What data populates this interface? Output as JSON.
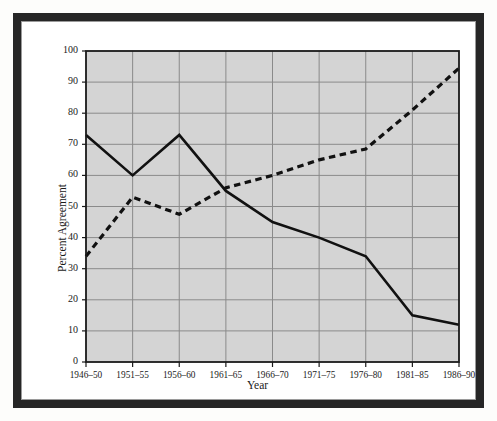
{
  "figure": {
    "background_color": "#ffffff",
    "frame_color": "#262626",
    "plot_background_color": "#d4d4d4",
    "grid_color": "#8a8a8a",
    "axis_color": "#1a1a1a"
  },
  "chart_data": {
    "type": "line",
    "title": "",
    "xlabel": "Year",
    "ylabel": "Percent Agreement",
    "categories": [
      "1946–50",
      "1951–55",
      "1956–60",
      "1961–65",
      "1966–70",
      "1971–75",
      "1976–80",
      "1981–85",
      "1986–90"
    ],
    "ylim": [
      0,
      100
    ],
    "yticks": [
      0,
      10,
      20,
      30,
      40,
      50,
      60,
      70,
      80,
      90,
      100
    ],
    "grid": true,
    "legend_position": "inline-annotations",
    "series": [
      {
        "name": "United States",
        "style": "solid",
        "color": "#111111",
        "values": [
          73,
          60,
          73,
          55,
          45,
          40,
          34,
          15,
          12
        ]
      },
      {
        "name": "Soviet Union",
        "style": "dashed",
        "color": "#111111",
        "values": [
          34,
          53,
          47.5,
          56,
          60,
          65,
          68.5,
          81,
          94.5
        ]
      }
    ],
    "annotations": [
      {
        "text": "United States",
        "series": "United States"
      },
      {
        "text": "Soviet Union",
        "series": "Soviet Union"
      }
    ]
  }
}
